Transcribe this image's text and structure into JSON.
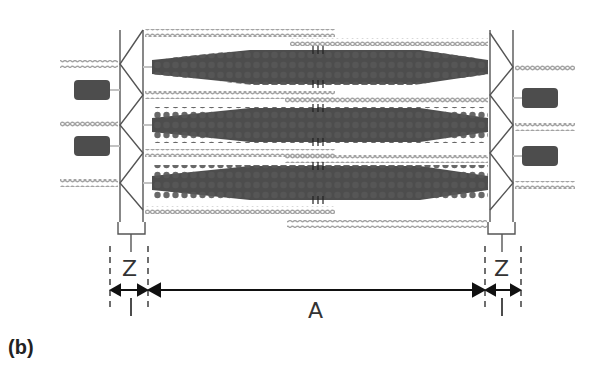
{
  "figure": {
    "panel_label": "(b)",
    "labels": {
      "z_left": "Z",
      "z_right": "Z",
      "i_left": "I",
      "i_right": "I",
      "a_band": "A"
    },
    "colors": {
      "thick_filament": "#4a4a4a",
      "thin_filament": "#a8a8a8",
      "z_line": "#555555",
      "titin": "#c2c2c2",
      "arrow": "#111111"
    },
    "structure": {
      "thick_filaments": 3,
      "z_discs": 2,
      "partial_thick_filaments_outside": 4
    }
  }
}
